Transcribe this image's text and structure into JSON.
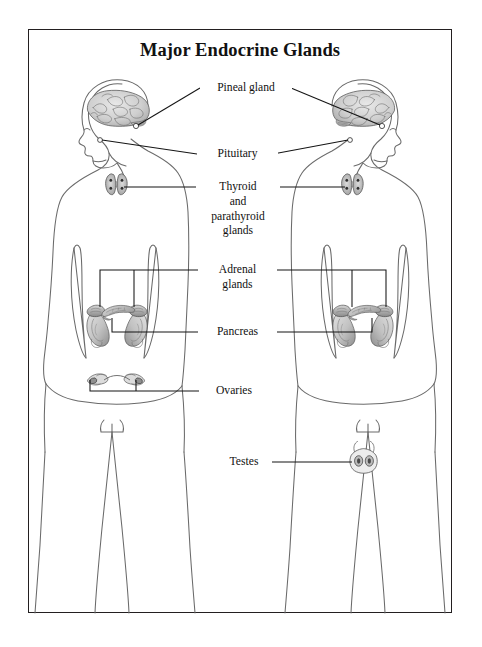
{
  "title": "Major Endocrine Glands",
  "labels": {
    "pineal": "Pineal gland",
    "pituitary": "Pituitary",
    "thyroid": "Thyroid\nand\nparathyroid\nglands",
    "adrenal": "Adrenal\nglands",
    "pancreas": "Pancreas",
    "ovaries": "Ovaries",
    "testes": "Testes"
  },
  "colors": {
    "frame": "#231f20",
    "outline": "#5a5a5a",
    "leader": "#1a1a1a",
    "organ_fill": "#d8d8d8",
    "organ_shade": "#9a9a9a",
    "organ_dark": "#4a4a4a"
  },
  "figures": {
    "left": "female-body-outline",
    "right": "male-body-outline"
  },
  "organs": [
    "brain-left",
    "brain-right",
    "pineal-dot-left",
    "pineal-dot-right",
    "pituitary-dot-left",
    "pituitary-dot-right",
    "thyroid-left",
    "thyroid-right",
    "adrenal-kidney-left",
    "adrenal-kidney-right",
    "pancreas-left",
    "pancreas-right",
    "ovaries",
    "testes"
  ]
}
